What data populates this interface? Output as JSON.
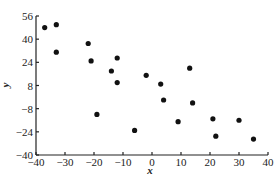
{
  "chart_data": {
    "type": "scatter",
    "title": "",
    "xlabel": "x",
    "ylabel": "y",
    "xlim": [
      -40,
      40
    ],
    "ylim": [
      -40,
      56
    ],
    "xticks": [
      -40,
      -30,
      -20,
      -10,
      0,
      10,
      20,
      30,
      40
    ],
    "yticks": [
      -40,
      -24,
      -8,
      8,
      24,
      40,
      56
    ],
    "grid": false,
    "legend": null,
    "points": [
      {
        "x": -37,
        "y": 48
      },
      {
        "x": -33,
        "y": 50
      },
      {
        "x": -33,
        "y": 31
      },
      {
        "x": -22,
        "y": 37
      },
      {
        "x": -21,
        "y": 25
      },
      {
        "x": -19,
        "y": -12
      },
      {
        "x": -14,
        "y": 18
      },
      {
        "x": -12,
        "y": 27
      },
      {
        "x": -12,
        "y": 10
      },
      {
        "x": -6,
        "y": -23
      },
      {
        "x": -2,
        "y": 15
      },
      {
        "x": 3,
        "y": 9
      },
      {
        "x": 4,
        "y": -2
      },
      {
        "x": 9,
        "y": -17
      },
      {
        "x": 13,
        "y": 20
      },
      {
        "x": 14,
        "y": -4
      },
      {
        "x": 21,
        "y": -15
      },
      {
        "x": 22,
        "y": -27
      },
      {
        "x": 30,
        "y": -16
      },
      {
        "x": 35,
        "y": -29
      }
    ]
  },
  "colors": {
    "points": "#111111",
    "axes": "#222222"
  }
}
